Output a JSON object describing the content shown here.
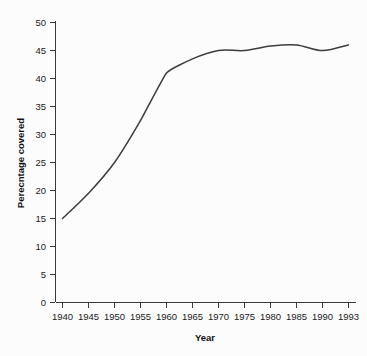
{
  "chart_data": {
    "type": "line",
    "title": "",
    "subtitle": "",
    "xlabel": "Year",
    "ylabel": "Perecntage covered",
    "xtick_labels": [
      "1940",
      "1945",
      "1950",
      "1955",
      "1960",
      "1965",
      "1970",
      "1975",
      "1980",
      "1985",
      "1990",
      "1993"
    ],
    "ytick_labels": [
      "0",
      "5",
      "10",
      "15",
      "20",
      "25",
      "30",
      "35",
      "40",
      "45",
      "50"
    ],
    "ylim": [
      0,
      50
    ],
    "xlim": [
      "1940",
      "1993"
    ],
    "grid": false,
    "legend": "none",
    "line_color": "#3d3d3d",
    "x": [
      1940,
      1945,
      1950,
      1955,
      1960,
      1965,
      1970,
      1975,
      1980,
      1985,
      1990,
      1993
    ],
    "values": [
      15,
      19.5,
      25,
      32.5,
      41,
      43.5,
      45,
      45,
      45.8,
      46,
      45,
      46
    ],
    "series": [
      {
        "name": "Percentage covered",
        "values": [
          15,
          19.5,
          25,
          32.5,
          41,
          43.5,
          45,
          45,
          45.8,
          46,
          45,
          46
        ]
      }
    ],
    "annotations": []
  },
  "axes": {
    "x_axis_name": "x-axis",
    "y_axis_name": "y-axis"
  }
}
